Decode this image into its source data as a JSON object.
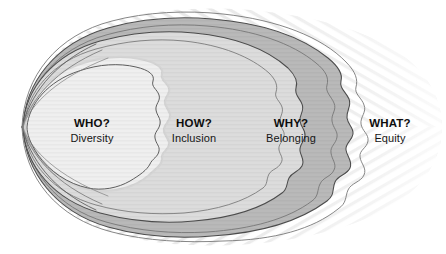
{
  "diagram": {
    "type": "concentric-ovals",
    "zones": [
      {
        "id": "who",
        "question": "WHO?",
        "concept": "Diversity",
        "fill": "#efefef",
        "order": 1
      },
      {
        "id": "how",
        "question": "HOW?",
        "concept": "Inclusion",
        "fill": "#dcdcdc",
        "order": 2
      },
      {
        "id": "why",
        "question": "WHY?",
        "concept": "Belonging",
        "fill": "#b9b9b9",
        "order": 3
      },
      {
        "id": "what",
        "question": "WHAT?",
        "concept": "Equity",
        "fill": "#ffffff",
        "order": 4
      }
    ],
    "colors": {
      "outline": "#4a4a4a",
      "outline_light": "#8c8c8c",
      "text": "#111111",
      "background": "#ffffff",
      "hatch": "#e4e4e4"
    }
  }
}
